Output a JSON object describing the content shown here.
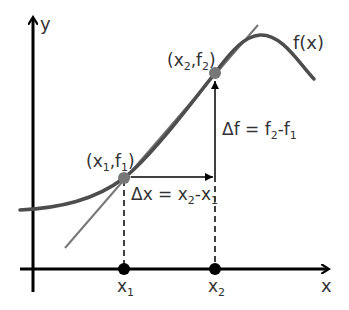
{
  "diagram": {
    "axes": {
      "x_label": "x",
      "y_label": "y"
    },
    "function_label": "f(x)",
    "points": [
      {
        "label_x": "x",
        "label_sub_x": "1",
        "label_f": "f",
        "label_sub_f": "1",
        "axis_label": "x",
        "axis_sub": "1"
      },
      {
        "label_x": "x",
        "label_sub_x": "2",
        "label_f": "f",
        "label_sub_f": "2",
        "axis_label": "x",
        "axis_sub": "2"
      }
    ],
    "delta_x": {
      "prefix": "Δx = x",
      "sub_a": "2",
      "mid": "-x",
      "sub_b": "1"
    },
    "delta_f": {
      "prefix": "Δf = f",
      "sub_a": "2",
      "mid": "-f",
      "sub_b": "1"
    },
    "colors": {
      "axis": "#000000",
      "curve": "#4d4d4d",
      "secant": "#777777",
      "point": "#777777",
      "text": "#333333"
    }
  }
}
